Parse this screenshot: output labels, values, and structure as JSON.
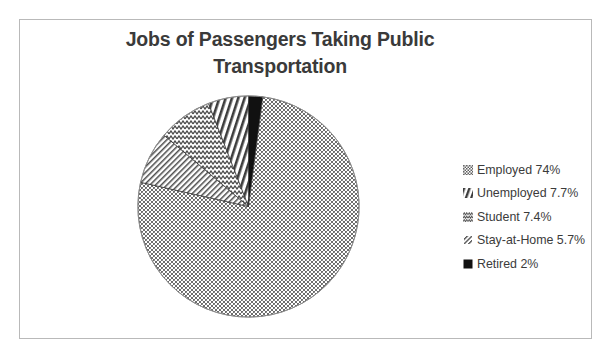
{
  "chart_data": {
    "type": "pie",
    "title": "Jobs of Passengers Taking Public Transportation",
    "title_line_1": "Jobs of Passengers Taking Public",
    "title_line_2": "Transportation",
    "categories": [
      "Employed",
      "Unemployed",
      "Student",
      "Stay-at-Home",
      "Retired"
    ],
    "values": [
      74,
      7.7,
      7.4,
      5.7,
      2
    ],
    "value_labels": [
      "74%",
      "7.7%",
      "7.4%",
      "5.7%",
      "2%"
    ],
    "legend_entries": [
      {
        "label": "Employed 74%",
        "name": "Employed",
        "value": 74,
        "value_label": "74%",
        "pattern": "stipple-gray",
        "swatch_icon": "stipple-swatch-icon"
      },
      {
        "label": "Unemployed 7.7%",
        "name": "Unemployed",
        "value": 7.7,
        "value_label": "7.7%",
        "pattern": "wave",
        "swatch_icon": "wave-swatch-icon"
      },
      {
        "label": "Student 7.4%",
        "name": "Student",
        "value": 7.4,
        "value_label": "7.4%",
        "pattern": "fine-diagonal",
        "swatch_icon": "fine-diagonal-swatch-icon"
      },
      {
        "label": "Stay-at-Home 5.7%",
        "name": "Stay-at-Home",
        "value": 5.7,
        "value_label": "5.7%",
        "pattern": "bold-diagonal",
        "swatch_icon": "bold-diagonal-swatch-icon"
      },
      {
        "label": "Retired 2%",
        "name": "Retired",
        "value": 2,
        "value_label": "2%",
        "pattern": "solid-black",
        "swatch_icon": "solid-black-swatch-icon"
      }
    ],
    "legend_position": "right",
    "start_angle_deg": 0,
    "direction": "clockwise",
    "grid": false,
    "colors": {
      "title_text": "#3a3a3a",
      "legend_text": "#3b3b3b",
      "border": "#b9b9b9",
      "background": "#ffffff",
      "pattern_ink": "#4a4a4a",
      "solid_black": "#111111"
    }
  }
}
